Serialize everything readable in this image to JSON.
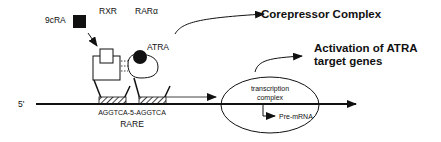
{
  "diagram": {
    "ligands": {
      "rexinoid": "9cRA",
      "retinoid": "ATRA"
    },
    "receptors": {
      "rxr": "RXR",
      "rar": "RARα"
    },
    "dna": {
      "strand_end": "5'",
      "response_element_sequence": "AGGTCA-5-AGGTCA",
      "response_element_name": "RARE"
    },
    "transcription": {
      "complex_line1": "transcription",
      "complex_line2": "complex",
      "product": "Pre-mRNA"
    },
    "outcomes": {
      "corepressor": "Corepressor Complex",
      "activation_line1": "Activation of ATRA",
      "activation_line2": "target genes"
    }
  }
}
